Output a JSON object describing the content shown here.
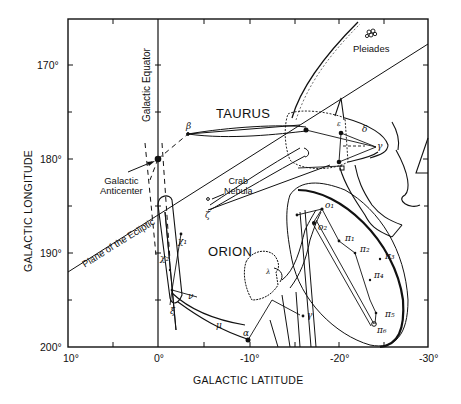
{
  "figure": {
    "type": "sky-chart"
  },
  "axes": {
    "x_title": "GALACTIC LATITUDE",
    "y_title": "GALACTIC LONGITUDE",
    "x_ticks": [
      "10°",
      "0°",
      "-10°",
      "-20°",
      "-30°"
    ],
    "y_ticks": [
      "170°",
      "180°",
      "190°",
      "200°"
    ],
    "x_range": [
      10,
      -30
    ],
    "y_range": [
      165,
      200
    ]
  },
  "labels": {
    "galactic_equator": "Galactic Equator",
    "galactic_anticenter_line1": "Galactic",
    "galactic_anticenter_line2": "Anticenter",
    "ecliptic": "Plane of the Ecliptic",
    "taurus": "TAURUS",
    "orion": "ORION",
    "pleiades": "Pleiades",
    "crab_line1": "Crab",
    "crab_line2": "Nebula"
  },
  "stars": {
    "taurus": {
      "beta": "β",
      "zeta": "ζ",
      "epsilon": "ε",
      "delta": "δ",
      "gamma": "γ"
    },
    "orion": {
      "chi1": "χ₁",
      "chi2": "χ₂",
      "nu": "ν",
      "xi": "ξ",
      "mu": "μ",
      "alpha": "α",
      "gamma": "γ",
      "lambda": "λ",
      "o1": "o₁",
      "o2": "o₂",
      "pi1": "π₁",
      "pi2": "π₂",
      "pi3": "π₃",
      "pi4": "π₄",
      "pi5": "π₅",
      "pi6": "π₆"
    }
  },
  "colors": {
    "ink": "#111111",
    "background": "#ffffff"
  }
}
